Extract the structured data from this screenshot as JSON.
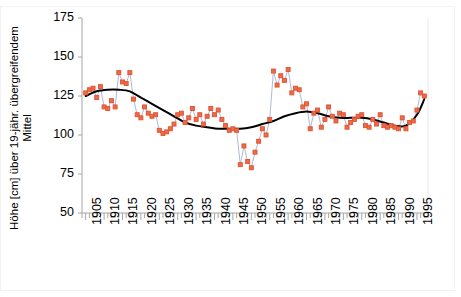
{
  "chart_data": {
    "type": "line",
    "title": "",
    "subtitle": "",
    "xlabel": "",
    "ylabel": "Höhe [cm] über 19-jähr. übergreifendem Mittel",
    "ylabel_lines": [
      "Höhe [cm] über 19-jähr. übergreifendem",
      "Mittel"
    ],
    "ylim": [
      50,
      175
    ],
    "yticks": [
      50,
      75,
      100,
      125,
      150,
      175
    ],
    "xlim": [
      1904,
      1998
    ],
    "xticks": [
      1905,
      1910,
      1915,
      1920,
      1925,
      1930,
      1935,
      1940,
      1945,
      1950,
      1955,
      1960,
      1965,
      1970,
      1975,
      1980,
      1985,
      1990,
      1995
    ],
    "xtick_minor_step": 1,
    "grid": false,
    "legend": "none",
    "colors": {
      "marker": "#e2512e",
      "marker_fill": "#ea6b4d",
      "connector": "#9aa7c8",
      "trend": "#000000",
      "axis": "#a6a6a6",
      "text": "#000000",
      "frame": "#f2f2f2",
      "background": "#ffffff"
    },
    "series": [
      {
        "name": "Jahreswert",
        "type": "scatter-line",
        "marker": "square",
        "x": [
          1905,
          1906,
          1907,
          1908,
          1909,
          1910,
          1911,
          1912,
          1913,
          1914,
          1915,
          1916,
          1917,
          1918,
          1919,
          1920,
          1921,
          1922,
          1923,
          1924,
          1925,
          1926,
          1927,
          1928,
          1929,
          1930,
          1931,
          1932,
          1933,
          1934,
          1935,
          1936,
          1937,
          1938,
          1939,
          1940,
          1941,
          1942,
          1943,
          1944,
          1945,
          1946,
          1947,
          1948,
          1949,
          1950,
          1951,
          1952,
          1953,
          1954,
          1955,
          1956,
          1957,
          1958,
          1959,
          1960,
          1961,
          1962,
          1963,
          1964,
          1965,
          1966,
          1967,
          1968,
          1969,
          1970,
          1971,
          1972,
          1973,
          1974,
          1975,
          1976,
          1977,
          1978,
          1979,
          1980,
          1981,
          1982,
          1983,
          1984,
          1985,
          1986,
          1987,
          1988,
          1989,
          1990,
          1991,
          1992,
          1993,
          1994,
          1995,
          1996,
          1997
        ],
        "values": [
          127,
          129,
          130,
          124,
          131,
          118,
          117,
          122,
          118,
          140,
          134,
          133,
          140,
          123,
          113,
          111,
          118,
          114,
          112,
          113,
          103,
          101,
          102,
          104,
          107,
          113,
          114,
          108,
          111,
          117,
          110,
          113,
          107,
          112,
          117,
          113,
          116,
          110,
          106,
          103,
          104,
          103,
          81,
          93,
          83,
          79,
          89,
          96,
          104,
          100,
          110,
          141,
          132,
          138,
          135,
          142,
          127,
          130,
          129,
          118,
          120,
          104,
          114,
          116,
          105,
          110,
          118,
          112,
          109,
          114,
          113,
          105,
          108,
          110,
          112,
          113,
          106,
          105,
          110,
          107,
          113,
          106,
          105,
          106,
          105,
          104,
          111,
          104,
          108,
          109,
          116,
          127,
          125
        ]
      },
      {
        "name": "19-jähriges übergreifendes Mittel",
        "type": "line",
        "x": [
          1905,
          1908,
          1911,
          1914,
          1917,
          1920,
          1923,
          1926,
          1929,
          1932,
          1935,
          1938,
          1941,
          1944,
          1947,
          1950,
          1953,
          1956,
          1959,
          1962,
          1965,
          1968,
          1971,
          1974,
          1977,
          1980,
          1983,
          1986,
          1989,
          1992,
          1995,
          1997
        ],
        "values": [
          125,
          128,
          129,
          129,
          128,
          124,
          120,
          116,
          112,
          108,
          106,
          105,
          104,
          104,
          104,
          105,
          107,
          109,
          112,
          114,
          115,
          114,
          112,
          111,
          111,
          111,
          110,
          108,
          106,
          106,
          113,
          123
        ]
      }
    ]
  }
}
